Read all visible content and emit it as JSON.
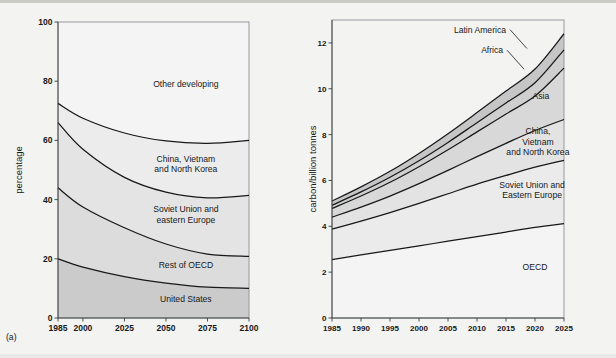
{
  "figure": {
    "background_color": "#f3f3f1",
    "panels": [
      {
        "tag": "(a)"
      },
      {
        "tag": "(b)"
      }
    ]
  },
  "chart_data": [
    {
      "panel": "(a)",
      "type": "area",
      "stacked": true,
      "title": "",
      "xlabel": "",
      "ylabel": "percentage",
      "xlim": [
        1985,
        2100
      ],
      "ylim": [
        0,
        100
      ],
      "grid": false,
      "legend_position": "in-plot-labels",
      "xticks": [
        1985,
        2000,
        2025,
        2050,
        2075,
        2100
      ],
      "yticks": [
        0,
        20,
        40,
        60,
        80,
        100
      ],
      "x": [
        1985,
        2000,
        2025,
        2050,
        2075,
        2100
      ],
      "boundaries": [
        {
          "name": "United States",
          "values": [
            20.0,
            17.2,
            14.0,
            11.8,
            10.4,
            10.0
          ]
        },
        {
          "name": "Rest of OECD",
          "values": [
            44.0,
            37.5,
            30.5,
            25.0,
            21.6,
            20.8
          ]
        },
        {
          "name": "Soviet Union and eastern Europe",
          "values": [
            66.0,
            57.0,
            47.5,
            42.5,
            40.6,
            41.4
          ]
        },
        {
          "name": "China, Vietnam and North Korea",
          "values": [
            72.5,
            67.5,
            62.5,
            59.8,
            59.0,
            60.0
          ]
        },
        {
          "name": "Other developing",
          "values": [
            100,
            100,
            100,
            100,
            100,
            100
          ]
        }
      ],
      "bands": [
        {
          "label": "Other developing",
          "fill": "#cbcbcb",
          "label_x": 2062,
          "label_y": 78
        },
        {
          "label_lines": [
            "China, Vietnam",
            "and North Korea"
          ],
          "label": "China, Vietnam and North Korea",
          "fill": "#dcdcdc",
          "label_x": 2062,
          "label_y": 51
        },
        {
          "label_lines": [
            "Soviet Union and",
            "eastern Europe"
          ],
          "label": "Soviet Union and eastern Europe",
          "fill": "#e4e4e4",
          "label_x": 2062,
          "label_y": 34
        },
        {
          "label": "Rest of OECD",
          "fill": "#ececec",
          "label_x": 2062,
          "label_y": 17
        },
        {
          "label": "United States",
          "fill": "#f4f4f4",
          "label_x": 2062,
          "label_y": 5.5
        }
      ]
    },
    {
      "panel": "(b)",
      "type": "area",
      "stacked": true,
      "title": "",
      "xlabel": "",
      "ylabel": "carbon/billion tonnes",
      "xlim": [
        1985,
        2025
      ],
      "ylim": [
        0,
        13
      ],
      "grid": false,
      "legend_position": "in-plot-labels",
      "xticks": [
        1985,
        1990,
        1995,
        2000,
        2005,
        2010,
        2015,
        2020,
        2025
      ],
      "yticks": [
        0,
        2,
        4,
        6,
        8,
        10,
        12
      ],
      "x": [
        1985,
        1990,
        1995,
        2000,
        2005,
        2010,
        2015,
        2020,
        2025
      ],
      "boundaries": [
        {
          "name": "OECD",
          "values": [
            2.55,
            2.75,
            2.95,
            3.15,
            3.35,
            3.55,
            3.75,
            3.95,
            4.12
          ]
        },
        {
          "name": "Soviet Union and Eastern Europe",
          "values": [
            3.88,
            4.23,
            4.6,
            5.0,
            5.42,
            5.84,
            6.22,
            6.58,
            6.88
          ]
        },
        {
          "name": "China, Vietnam and North Korea",
          "values": [
            4.4,
            4.84,
            5.32,
            5.86,
            6.44,
            7.04,
            7.62,
            8.18,
            8.66
          ]
        },
        {
          "name": "Asia",
          "values": [
            4.78,
            5.32,
            5.92,
            6.6,
            7.34,
            8.12,
            8.9,
            9.68,
            10.9
          ]
        },
        {
          "name": "Africa",
          "values": [
            4.92,
            5.5,
            6.14,
            6.86,
            7.66,
            8.52,
            9.38,
            10.26,
            11.7
          ]
        },
        {
          "name": "Latin America",
          "values": [
            5.1,
            5.72,
            6.4,
            7.18,
            8.04,
            8.96,
            9.9,
            10.86,
            12.4
          ]
        }
      ],
      "bands": [
        {
          "label": "OECD",
          "fill": "#f4f4f4",
          "label_x": 2020,
          "label_y": 2.1
        },
        {
          "label_lines": [
            "Soviet Union and",
            "Eastern Europe"
          ],
          "label": "Soviet Union and Eastern Europe",
          "fill": "#ebebeb",
          "label_x": 2019.5,
          "label_y": 5.45
        },
        {
          "label_lines": [
            "China,",
            "Vietnam",
            "and North Korea"
          ],
          "label": "China, Vietnam and North Korea",
          "fill": "#e3e3e3",
          "label_x": 2020.5,
          "label_y": 7.55
        },
        {
          "label": "Asia",
          "fill": "#d8d8d8",
          "label_x": 2021,
          "label_y": 9.55
        },
        {
          "label": "Africa",
          "fill": "#cfcfcf",
          "label_x": 2014.5,
          "label_y": 11.55,
          "leader": true
        },
        {
          "label": "Latin America",
          "fill": "#c6c6c6",
          "label_x": 2015,
          "label_y": 12.45,
          "leader": true
        }
      ]
    }
  ]
}
